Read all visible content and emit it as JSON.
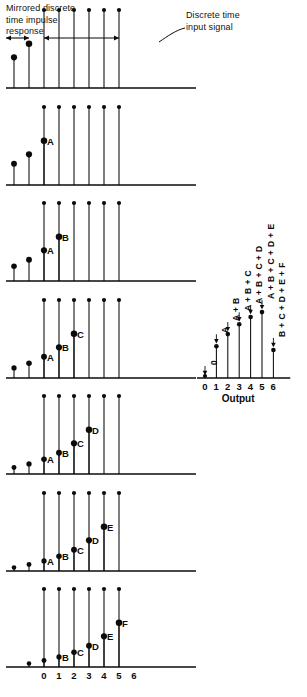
{
  "annotations": {
    "left_caption": "Mirrored discrete\ntime impulse\nresponse",
    "right_caption": "Discrete time\ninput signal"
  },
  "output_panel": {
    "title": "Output",
    "tick_labels": [
      "0",
      "1",
      "2",
      "3",
      "4",
      "5",
      "6"
    ],
    "term_labels": [
      "0",
      "A",
      "A + B",
      "A + B + C",
      "A + B + C + D",
      "A + B + C + D + E",
      "B + C + D + E + F"
    ]
  },
  "panels": [
    {
      "index": 0,
      "stem_labels": [],
      "tick_labels": []
    },
    {
      "index": 1,
      "stem_labels": [
        "A"
      ],
      "tick_labels": []
    },
    {
      "index": 2,
      "stem_labels": [
        "B",
        "A"
      ],
      "tick_labels": []
    },
    {
      "index": 3,
      "stem_labels": [
        "C",
        "B",
        "A"
      ],
      "tick_labels": []
    },
    {
      "index": 4,
      "stem_labels": [
        "D",
        "C",
        "B",
        "A"
      ],
      "tick_labels": []
    },
    {
      "index": 5,
      "stem_labels": [
        "E",
        "D",
        "C",
        "B",
        "A"
      ],
      "tick_labels": []
    },
    {
      "index": 6,
      "stem_labels": [
        "F",
        "E",
        "D",
        "C",
        "B"
      ],
      "tick_labels": [
        "0",
        "1",
        "2",
        "3",
        "4",
        "5",
        "6"
      ]
    }
  ],
  "chart_data": {
    "type": "line",
    "title": "Output",
    "xlabel": "Output",
    "ylabel": "",
    "x": [
      0,
      1,
      2,
      3,
      4,
      5,
      6
    ],
    "values": [
      0,
      2.6,
      3.6,
      4.4,
      5.0,
      5.4,
      2.3
    ],
    "point_labels": [
      "0",
      "A",
      "A + B",
      "A + B + C",
      "A + B + C + D",
      "A + B + C + D + E",
      "B + C + D + E + F"
    ],
    "xlim": [
      0,
      6
    ],
    "ylim": [
      0,
      6
    ],
    "grid": false,
    "legend": null,
    "series": [
      {
        "name": "convolution output",
        "values": [
          0,
          2.6,
          3.6,
          4.4,
          5.0,
          5.4,
          2.3
        ]
      }
    ]
  },
  "impulse_response": {
    "name": "mirrored discrete time impulse response",
    "type": "stem",
    "values": [
      0.3,
      0.55,
      0.85,
      1.25,
      1.8,
      2.6,
      3.75
    ],
    "labels": [
      "F",
      "E",
      "D",
      "C",
      "B",
      "A",
      ""
    ]
  },
  "input_signal": {
    "name": "discrete time input signal",
    "type": "stem",
    "values": [
      6.6,
      6.6,
      6.6,
      6.6,
      6.6,
      6.6
    ],
    "count": 6
  },
  "colors": {
    "ink": "#0b0b0b",
    "line": "#111111",
    "background": "#ffffff"
  }
}
